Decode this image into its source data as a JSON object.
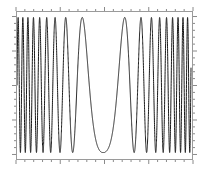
{
  "figure": {
    "name": "chirp-waveform-figure",
    "width": 205,
    "height": 177,
    "background_color": "#ffffff",
    "frame_color": "#9a9a9a",
    "trace_color": "#1a1a1a",
    "title": "",
    "caption": ""
  },
  "axes": {
    "left": 16,
    "top": 11,
    "width": 177,
    "height": 149,
    "tick_direction": "out",
    "tick_color": "#8a8a8a",
    "tick_length_major": 4,
    "tick_length_minor": 2,
    "grid": false,
    "x_tick_labels": [],
    "y_tick_labels": [],
    "xlabel": "",
    "ylabel": ""
  },
  "chart_data": {
    "type": "line",
    "title": "",
    "subtitle": "",
    "xlabel": "",
    "ylabel": "",
    "xlim": [
      0,
      1
    ],
    "ylim": [
      -1.08,
      1.08
    ],
    "grid": false,
    "legend": [],
    "legend_position": "none",
    "annotations": [],
    "series": [
      {
        "name": "chirp",
        "color": "#1a1a1a",
        "line_width": 1,
        "description": "Frequency-swept oscillation: frequency is high at both ends, decreases to a minimum near the center of the record, then increases again. Amplitude is constant and nearly fills the frame.",
        "model": {
          "kind": "v-chirp",
          "samples": 4000,
          "amplitude": 1.0,
          "center": 0.5,
          "phase_offset": 0.0,
          "freq_min_cycles_per_unit": 1.6,
          "freq_max_cycles_per_unit": 39.0,
          "freq_exponent": 1.35,
          "asymmetry": 1.06
        },
        "x_ticks_major": [
          0.0,
          0.25,
          0.5,
          0.75,
          1.0
        ],
        "y_ticks_major": [
          -1.0,
          -0.5,
          0.0,
          0.5,
          1.0
        ],
        "minor_ticks_per_major_x": 5,
        "minor_ticks_per_major_y": 5,
        "approx_cycle_count": 41,
        "peak_top_value": 1.0,
        "peak_bottom_value": -1.0
      }
    ]
  }
}
